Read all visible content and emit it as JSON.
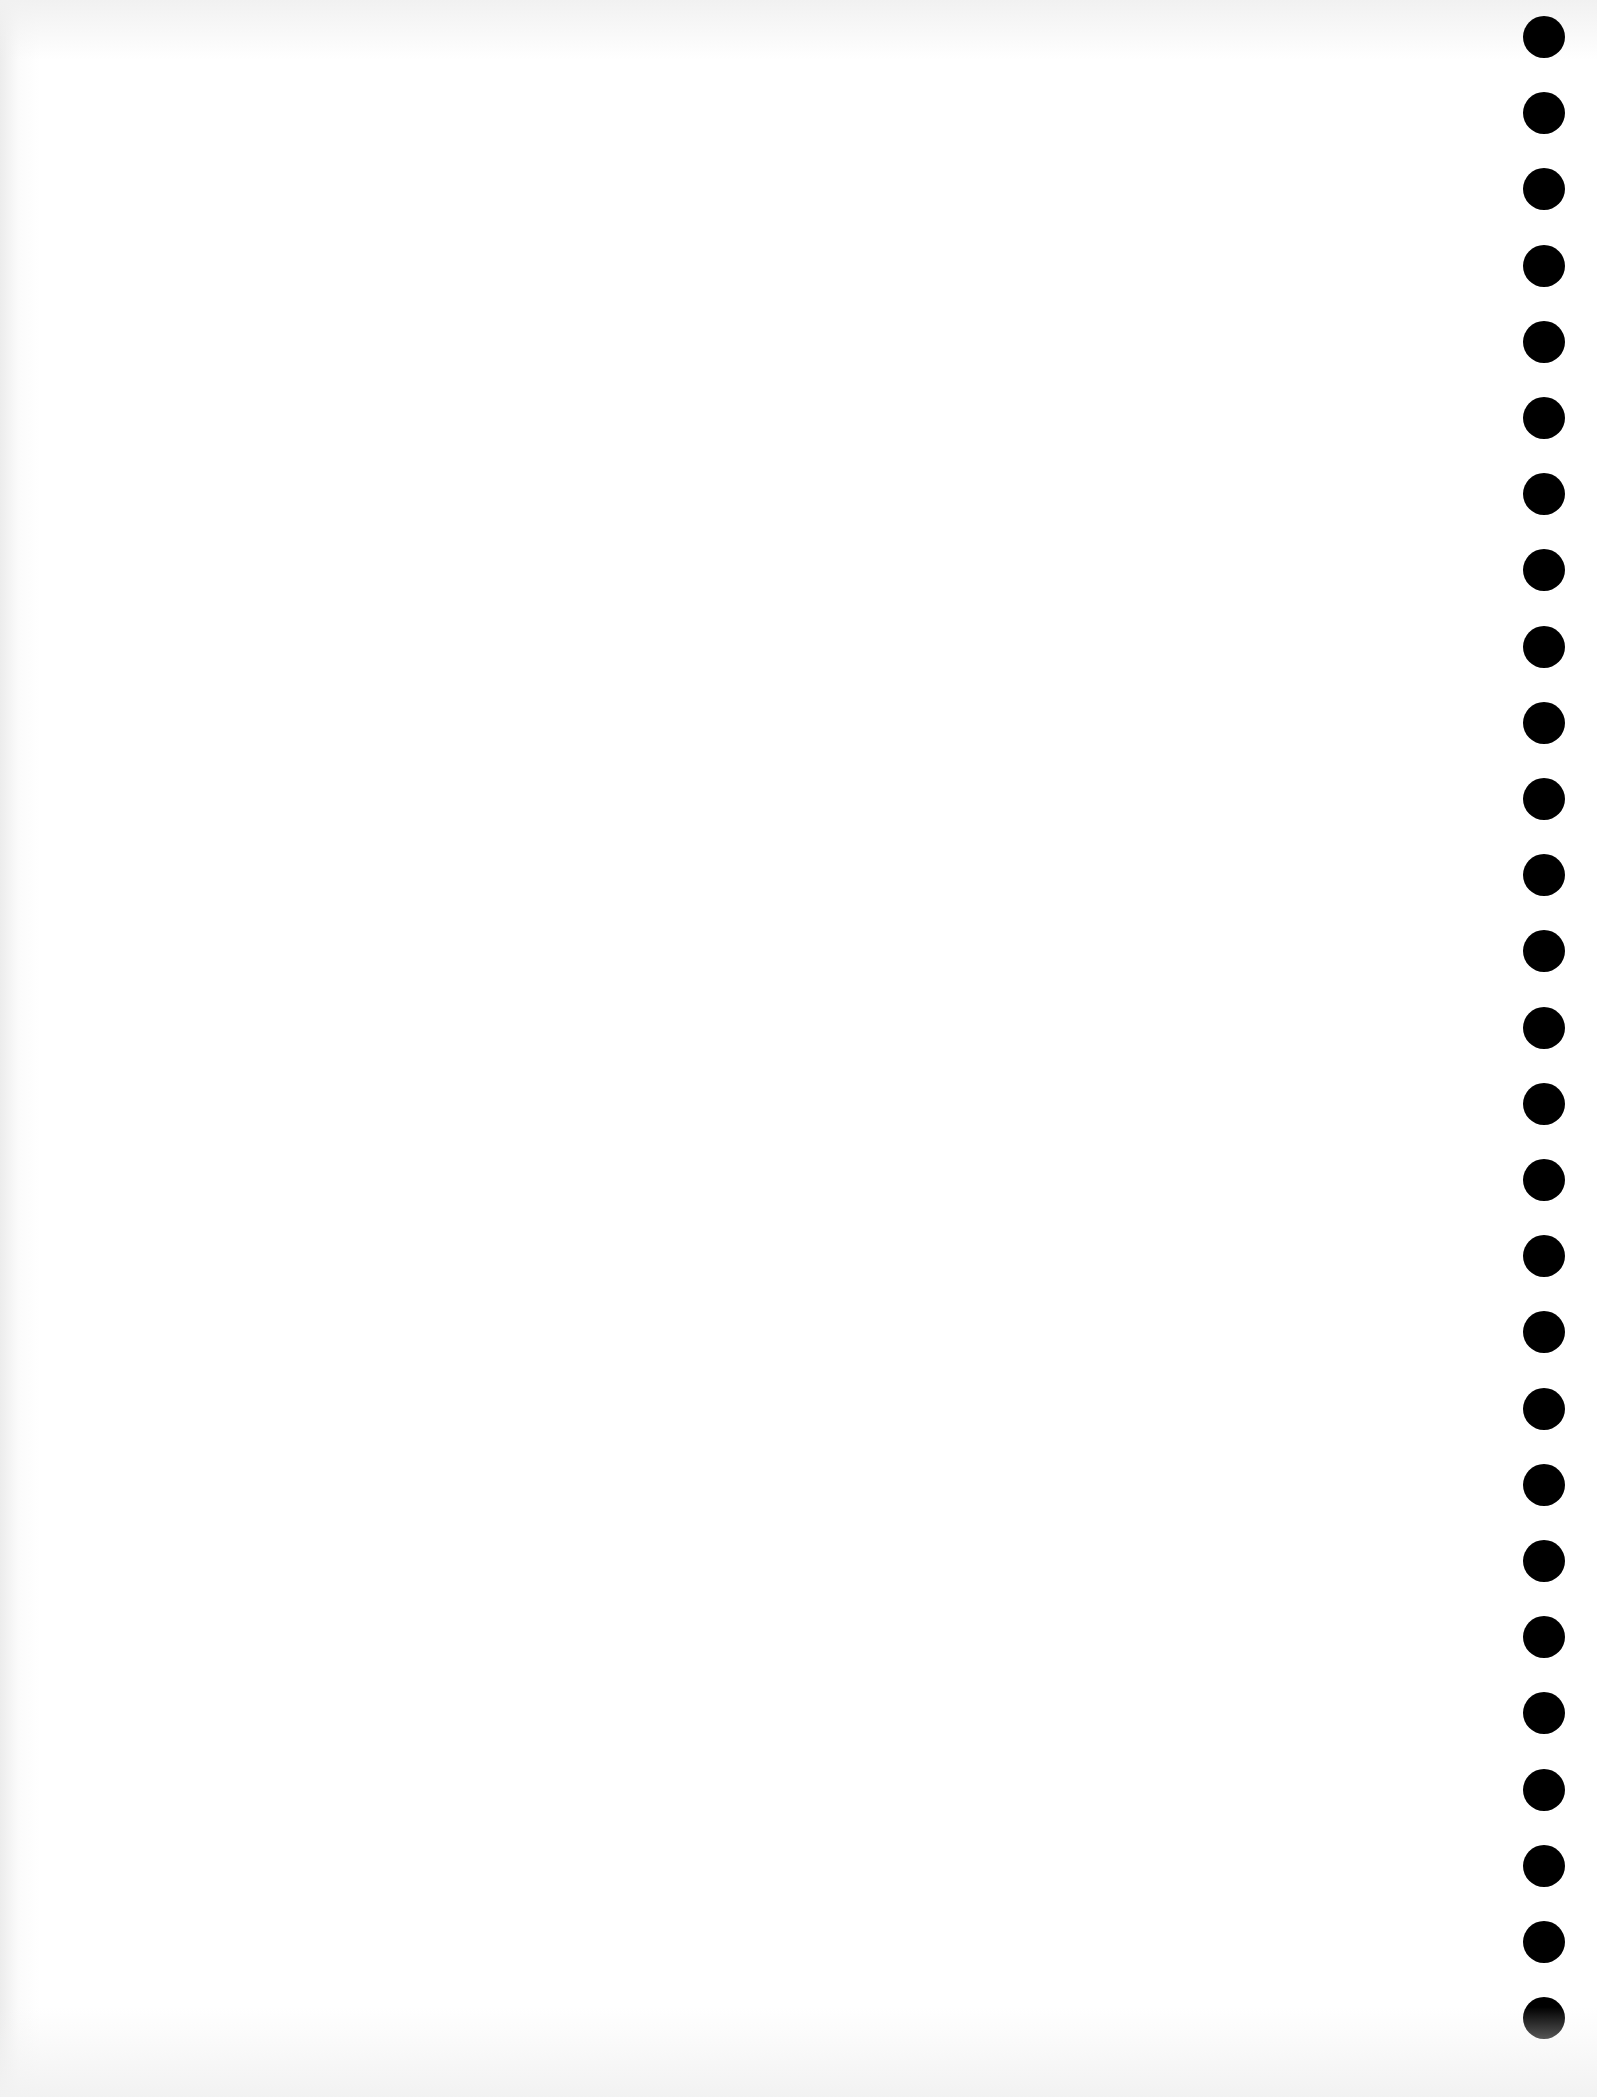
{
  "page": {
    "background": "#ffffff",
    "text_content": ""
  },
  "punch_holes": {
    "count": 27,
    "color": "#000000",
    "side": "right"
  }
}
